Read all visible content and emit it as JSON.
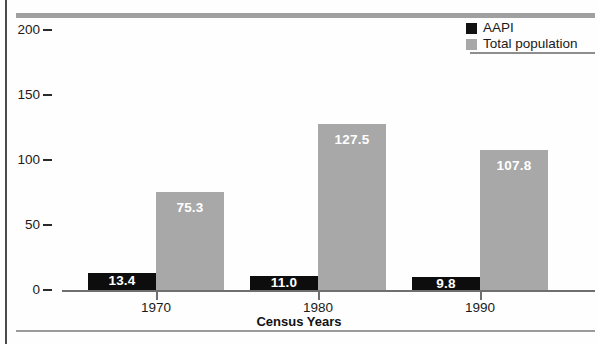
{
  "chart_data": {
    "type": "bar",
    "title": "",
    "xlabel": "Census Years",
    "ylabel": "",
    "categories": [
      "1970",
      "1980",
      "1990"
    ],
    "series": [
      {
        "name": "AAPI",
        "color": "#0d0d0d",
        "values": [
          13.4,
          11.0,
          9.8
        ],
        "value_labels": [
          "13.4",
          "11.0",
          "9.8"
        ]
      },
      {
        "name": "Total population",
        "color": "#a8a8a8",
        "values": [
          75.3,
          127.5,
          107.8
        ],
        "value_labels": [
          "75.3",
          "127.5",
          "107.8"
        ]
      }
    ],
    "ylim": [
      0,
      200
    ],
    "yticks": [
      0,
      50,
      100,
      150,
      200
    ],
    "ytick_labels": [
      "0",
      "50",
      "100",
      "150",
      "200"
    ],
    "grid": false,
    "legend_position": "top-right"
  },
  "legend": {
    "entries": [
      {
        "label": "AAPI",
        "swatch": "aapi"
      },
      {
        "label": "Total population",
        "swatch": "total"
      }
    ]
  },
  "axes": {
    "x_title": "Census Years"
  },
  "colors": {
    "aapi": "#0d0d0d",
    "total_population": "#a8a8a8",
    "rule": "#a0a0a0",
    "text": "#1a1a1a"
  }
}
